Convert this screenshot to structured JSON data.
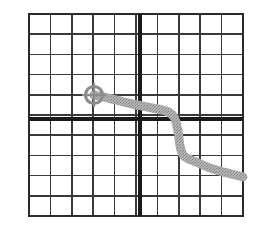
{
  "figure": {
    "background_color": "#ffffff",
    "width": 264,
    "height": 226
  },
  "grid": {
    "name": "graph-paper-grid",
    "columns": 10,
    "rows": 10,
    "left": 29,
    "top": 14,
    "right": 243,
    "bottom": 216,
    "cell_width": 21.4,
    "cell_height": 20.2,
    "minor_line_color": "#3a3a3a",
    "minor_line_width": 1.6,
    "border_color": "#2b2b2b",
    "border_width": 2.0
  },
  "axes": {
    "name": "bold-axes",
    "vertical_axis": {
      "label": "vertical-axis",
      "x": 140,
      "after_column": 5,
      "color": "#1a1a1a",
      "width": 4.2
    },
    "horizontal_axis": {
      "label": "horizontal-axis",
      "y": 119,
      "after_row": 5,
      "color": "#1a1a1a",
      "width": 4.2
    },
    "origin": {
      "x": 140,
      "y": 119
    }
  },
  "marker": {
    "name": "crosshair-target-marker",
    "center_x": 94,
    "center_y": 95,
    "radius": 8.5,
    "stroke_color": "#8c8c8c",
    "stroke_width": 3.2,
    "cross_arm_length": 12,
    "cross_stroke_width": 2.2,
    "grid_column": 4,
    "grid_row": 4
  },
  "chart_data": {
    "type": "line",
    "xlabel": "",
    "ylabel": "",
    "grid": true,
    "legend": null,
    "xlim": [
      0,
      10
    ],
    "ylim": [
      0,
      10
    ],
    "series": [
      {
        "name": "traced-curve",
        "color": "#a0a0a0",
        "stroke_width": 9,
        "texture": "dithered",
        "points_px": [
          [
            94,
            95
          ],
          [
            112,
            99
          ],
          [
            132,
            104
          ],
          [
            152,
            108
          ],
          [
            166,
            111
          ],
          [
            174,
            117
          ],
          [
            178,
            131
          ],
          [
            180,
            146
          ],
          [
            184,
            156
          ],
          [
            196,
            162
          ],
          [
            213,
            169
          ],
          [
            231,
            174
          ],
          [
            243,
            177
          ]
        ],
        "points_grid": [
          [
            3.04,
            5.99
          ],
          [
            3.88,
            5.79
          ],
          [
            4.81,
            5.54
          ],
          [
            5.75,
            5.35
          ],
          [
            6.4,
            5.2
          ],
          [
            6.78,
            4.9
          ],
          [
            6.96,
            4.21
          ],
          [
            7.06,
            3.47
          ],
          [
            7.24,
            2.97
          ],
          [
            7.8,
            2.67
          ],
          [
            8.6,
            2.33
          ],
          [
            9.44,
            2.08
          ],
          [
            10.0,
            1.93
          ]
        ]
      }
    ],
    "annotations": [
      {
        "name": "crosshair-start-point",
        "type": "crosshair",
        "x_px": 94,
        "y_px": 95,
        "x_grid": 3.04,
        "y_grid": 5.99
      }
    ]
  }
}
